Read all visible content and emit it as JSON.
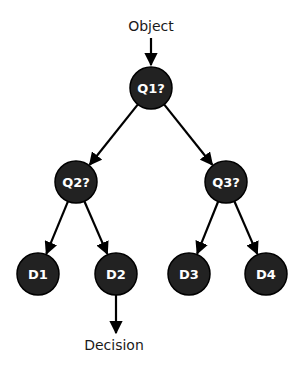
{
  "diagram": {
    "type": "decision-tree",
    "input_label": "Object",
    "output_label": "Decision",
    "node_fill": "#222222",
    "node_stroke": "#000000",
    "text_color": "#ffffff",
    "edge_color": "#000000",
    "nodes": [
      {
        "id": "Q1",
        "label": "Q1?",
        "x": 151,
        "y": 88,
        "kind": "question"
      },
      {
        "id": "Q2",
        "label": "Q2?",
        "x": 76,
        "y": 182,
        "kind": "question"
      },
      {
        "id": "Q3",
        "label": "Q3?",
        "x": 226,
        "y": 182,
        "kind": "question"
      },
      {
        "id": "D1",
        "label": "D1",
        "x": 38,
        "y": 274,
        "kind": "decision"
      },
      {
        "id": "D2",
        "label": "D2",
        "x": 116,
        "y": 274,
        "kind": "decision"
      },
      {
        "id": "D3",
        "label": "D3",
        "x": 189,
        "y": 274,
        "kind": "decision"
      },
      {
        "id": "D4",
        "label": "D4",
        "x": 266,
        "y": 274,
        "kind": "decision"
      }
    ],
    "edges": [
      {
        "from": "Q1",
        "to": "Q2"
      },
      {
        "from": "Q1",
        "to": "Q3"
      },
      {
        "from": "Q2",
        "to": "D1"
      },
      {
        "from": "Q2",
        "to": "D2"
      },
      {
        "from": "Q3",
        "to": "D3"
      },
      {
        "from": "Q3",
        "to": "D4"
      }
    ]
  }
}
